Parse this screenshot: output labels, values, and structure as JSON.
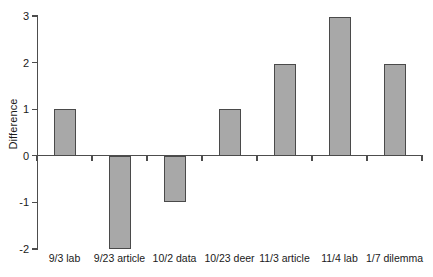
{
  "chart_data": {
    "type": "bar",
    "title": "",
    "subtitle": "",
    "xlabel": "",
    "ylabel": "Difference",
    "categories": [
      "9/3 lab",
      "9/23 article",
      "10/2 data",
      "10/23 deer",
      "11/3 article",
      "11/4 lab",
      "1/7 dilemma"
    ],
    "values": [
      1.0,
      -2.0,
      -1.0,
      1.0,
      1.97,
      2.97,
      1.97
    ],
    "series": [
      {
        "name": "Difference",
        "values": [
          1.0,
          -2.0,
          -1.0,
          1.0,
          1.97,
          2.97,
          1.97
        ]
      }
    ],
    "ylim": [
      -2,
      3
    ],
    "yticks": [
      3,
      2,
      1,
      0,
      -1,
      -2
    ],
    "ytick_labels": [
      "3",
      "2",
      "1",
      "0",
      "-1",
      "-2"
    ],
    "grid": false,
    "legend": false,
    "legend_position": "none",
    "annotations": [],
    "bar_color": "#a8a8a8",
    "bar_edge_color": "#4a4a4a",
    "axis_color": "#4d4d4d",
    "text_color": "#1a1a1a",
    "background_color": "#ffffff"
  }
}
